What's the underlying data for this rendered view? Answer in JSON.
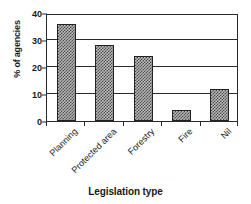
{
  "chart_data": {
    "type": "bar",
    "title": "",
    "xlabel": "Legislation type",
    "ylabel": "% of agencies",
    "categories": [
      "Planning",
      "Protected area",
      "Forestry",
      "Fire",
      "Nil"
    ],
    "values": [
      36,
      28,
      24,
      4,
      12
    ],
    "ylim": [
      0,
      40
    ],
    "yticks": [
      0,
      10,
      20,
      30,
      40
    ],
    "ytick_labels": [
      "0",
      "10",
      "20",
      "30",
      "40"
    ],
    "grid": true,
    "grid_axis": "y",
    "legend": false,
    "bar_fill": "#b9b9b9",
    "bar_edge": "#222222",
    "axis_color": "#2a2a2a",
    "background": "#ffffff",
    "xtick_label_rotation": -45
  }
}
